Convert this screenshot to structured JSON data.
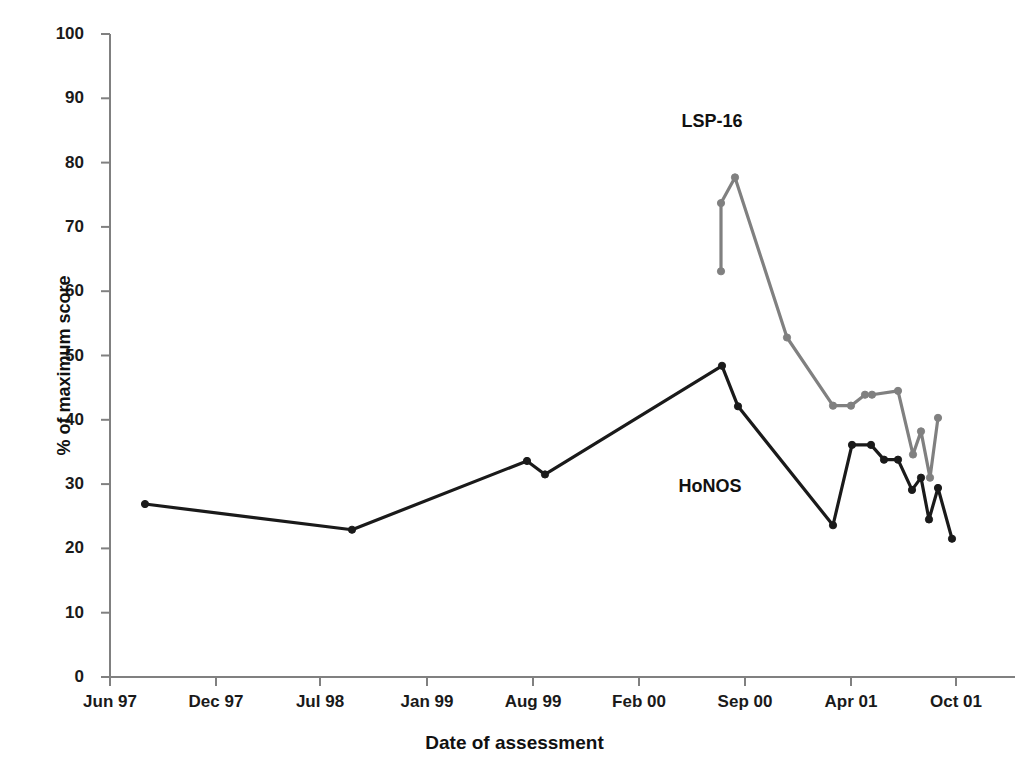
{
  "chart_data": {
    "type": "line",
    "title": "",
    "xlabel": "Date of assessment",
    "ylabel": "% of maximum score",
    "ylim": [
      0,
      100
    ],
    "ytick_values": [
      0,
      10,
      20,
      30,
      40,
      50,
      60,
      70,
      80,
      90,
      100
    ],
    "ytick_labels": [
      "0",
      "10",
      "20",
      "30",
      "40",
      "50",
      "60",
      "70",
      "80",
      "90",
      "100"
    ],
    "xtick_labels": [
      "Jun 97",
      "Dec 97",
      "Jul 98",
      "Jan 99",
      "Aug 99",
      "Feb 00",
      "Sep 00",
      "Apr 01",
      "Oct 01"
    ],
    "xtick_pixels": [
      110,
      216,
      320,
      427,
      533,
      639,
      745,
      851,
      956
    ],
    "grid": false,
    "legend_position": "inline-annotation",
    "x_axis_kind": "pixel",
    "series": [
      {
        "name": "LSP-16",
        "color": "#808080",
        "marker": "circle",
        "label_x": 712,
        "label_y": 111,
        "points": [
          {
            "px": 721,
            "value": 63.1
          },
          {
            "px": 721,
            "value": 73.7
          },
          {
            "px": 735,
            "value": 77.7
          },
          {
            "px": 787,
            "value": 52.8
          },
          {
            "px": 833,
            "value": 42.2
          },
          {
            "px": 851,
            "value": 42.2
          },
          {
            "px": 865,
            "value": 43.9
          },
          {
            "px": 872,
            "value": 43.9
          },
          {
            "px": 898,
            "value": 44.5
          },
          {
            "px": 913,
            "value": 34.6
          },
          {
            "px": 921,
            "value": 38.2
          },
          {
            "px": 930,
            "value": 31.0
          },
          {
            "px": 938,
            "value": 40.3
          }
        ]
      },
      {
        "name": "HoNOS",
        "color": "#1a1a1a",
        "marker": "circle",
        "label_x": 710,
        "label_y": 476,
        "points": [
          {
            "px": 145,
            "value": 26.9
          },
          {
            "px": 352,
            "value": 22.9
          },
          {
            "px": 527,
            "value": 33.6
          },
          {
            "px": 545,
            "value": 31.5
          },
          {
            "px": 722,
            "value": 48.4
          },
          {
            "px": 738,
            "value": 42.1
          },
          {
            "px": 833,
            "value": 23.6
          },
          {
            "px": 852,
            "value": 36.1
          },
          {
            "px": 871,
            "value": 36.1
          },
          {
            "px": 884,
            "value": 33.8
          },
          {
            "px": 898,
            "value": 33.8
          },
          {
            "px": 912,
            "value": 29.1
          },
          {
            "px": 921,
            "value": 31.0
          },
          {
            "px": 929,
            "value": 24.5
          },
          {
            "px": 938,
            "value": 29.4
          },
          {
            "px": 952,
            "value": 21.5
          }
        ]
      }
    ]
  }
}
